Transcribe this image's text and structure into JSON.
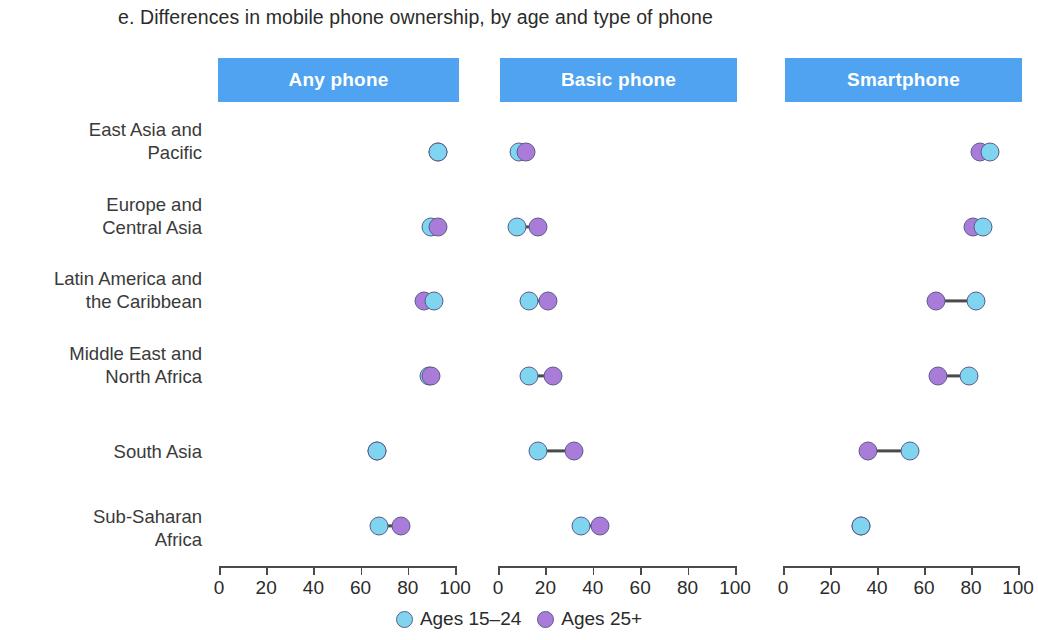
{
  "chart_data": {
    "type": "scatter",
    "subtype": "dumbbell",
    "title": "e. Differences in mobile phone ownership, by age and type of phone",
    "xlabel": "",
    "ylabel": "",
    "xlim": [
      0,
      100
    ],
    "xticks": [
      0,
      20,
      40,
      60,
      80,
      100
    ],
    "xticklabels": [
      "0",
      "20",
      "40",
      "60",
      "80",
      "100"
    ],
    "grid": false,
    "legend_position": "bottom",
    "categories": [
      "East Asia and\nPacific",
      "Europe and\nCentral Asia",
      "Latin America and\nthe Caribbean",
      "Middle East and\nNorth Africa",
      "South Asia",
      "Sub-Saharan\nAfrica"
    ],
    "panels": [
      {
        "label": "Any phone",
        "series": [
          {
            "name": "Ages 15-24",
            "values": [
              93,
              90,
              91,
              89,
              67,
              68
            ]
          },
          {
            "name": "Ages 25+",
            "values": [
              93,
              93,
              87,
              90,
              67,
              77
            ]
          }
        ]
      },
      {
        "label": "Basic phone",
        "series": [
          {
            "name": "Ages 15-24",
            "values": [
              9,
              8,
              13,
              13,
              17,
              35
            ]
          },
          {
            "name": "Ages 25+",
            "values": [
              12,
              17,
              21,
              23,
              32,
              43
            ]
          }
        ]
      },
      {
        "label": "Smartphone",
        "series": [
          {
            "name": "Ages 15-24",
            "values": [
              88,
              85,
              82,
              79,
              54,
              33
            ]
          },
          {
            "name": "Ages 25+",
            "values": [
              84,
              81,
              65,
              66,
              36,
              33
            ]
          }
        ]
      }
    ],
    "legend": [
      {
        "name": "Ages 15–24",
        "color": "#7fd4f0",
        "key": "young"
      },
      {
        "name": "Ages 25+",
        "color": "#a87cd8",
        "key": "older"
      }
    ],
    "colors": {
      "young": "#7fd4f0",
      "older": "#a87cd8",
      "panel_header": "#4fa3f0",
      "panel_header_text": "#ffffff",
      "connector": "#4a4a4a",
      "axis": "#4a4a4a",
      "text": "#2b2b2b",
      "background": "#ffffff"
    }
  }
}
